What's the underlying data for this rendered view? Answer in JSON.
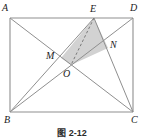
{
  "figure": {
    "kind": "plane-geometry-diagram",
    "caption": "图 2-12",
    "stroke_color": "#8a8a8a",
    "shade_color": "#d4d4d4",
    "label_color": "#1a1a1a",
    "vertices": [
      {
        "name": "A",
        "label": "A",
        "x": 10,
        "y": 18,
        "label_x": 2,
        "label_y": 3
      },
      {
        "name": "D",
        "label": "D",
        "x": 133,
        "y": 18,
        "label_x": 130,
        "label_y": 3
      },
      {
        "name": "B",
        "label": "B",
        "x": 10,
        "y": 112,
        "label_x": 4,
        "label_y": 115
      },
      {
        "name": "C",
        "label": "C",
        "x": 133,
        "y": 112,
        "label_x": 131,
        "label_y": 115
      },
      {
        "name": "E",
        "label": "E",
        "x": 94,
        "y": 18,
        "label_x": 90,
        "label_y": 4
      },
      {
        "name": "M",
        "label": "M",
        "x": 61,
        "y": 58,
        "label_x": 46,
        "label_y": 51
      },
      {
        "name": "N",
        "label": "N",
        "x": 108,
        "y": 48,
        "label_x": 110,
        "label_y": 40
      },
      {
        "name": "O",
        "label": "O",
        "x": 71,
        "y": 65,
        "label_x": 63,
        "label_y": 69
      }
    ],
    "segments": [
      {
        "name": "side-AD",
        "from": "A",
        "to": "D",
        "style": "solid"
      },
      {
        "name": "side-DC",
        "from": "D",
        "to": "C",
        "style": "solid"
      },
      {
        "name": "side-CB",
        "from": "C",
        "to": "B",
        "style": "solid"
      },
      {
        "name": "side-BA",
        "from": "B",
        "to": "A",
        "style": "solid"
      },
      {
        "name": "diagonal-AC",
        "from": "A",
        "to": "C",
        "style": "solid"
      },
      {
        "name": "diagonal-BD",
        "from": "B",
        "to": "D",
        "style": "solid"
      },
      {
        "name": "segment-BE",
        "from": "B",
        "to": "E",
        "style": "solid"
      },
      {
        "name": "segment-CE",
        "from": "C",
        "to": "E",
        "style": "solid"
      },
      {
        "name": "segment-EO",
        "from": "E",
        "to": "O",
        "style": "dashed"
      }
    ],
    "shaded_region": {
      "name": "triangle-MEN",
      "points": "M,E,N,O",
      "fill": "#d4d4d4"
    }
  }
}
